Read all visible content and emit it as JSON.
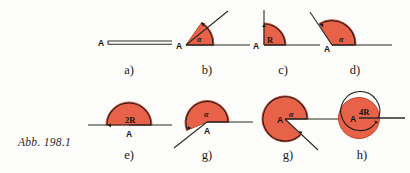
{
  "figure": {
    "caption": "Abb. 198.1",
    "background_color": "#fcfcfa",
    "sector_fill": "#e8624a",
    "sector_stroke": "#c03a22",
    "line_color": "#2b2b26",
    "panels": [
      {
        "id": "a",
        "label": "a)",
        "vertex_label": "A",
        "angle_label": "",
        "angle_degrees": 0,
        "description": "zero angle, two coincident rays drawn as double line",
        "type": "zero-angle"
      },
      {
        "id": "b",
        "label": "b)",
        "vertex_label": "A",
        "angle_label": "α",
        "angle_degrees": 55,
        "description": "acute angle alpha",
        "type": "acute-angle"
      },
      {
        "id": "c",
        "label": "c)",
        "vertex_label": "A",
        "angle_label": "R",
        "angle_degrees": 90,
        "description": "right angle R",
        "type": "right-angle"
      },
      {
        "id": "d",
        "label": "d)",
        "vertex_label": "A",
        "angle_label": "α",
        "angle_degrees": 120,
        "description": "obtuse angle alpha",
        "type": "obtuse-angle"
      },
      {
        "id": "e",
        "label": "e)",
        "vertex_label": "A",
        "angle_label": "2R",
        "angle_degrees": 180,
        "description": "straight angle 2R",
        "type": "straight-angle"
      },
      {
        "id": "f",
        "label": "f)",
        "vertex_label": "A",
        "angle_label": "α",
        "angle_degrees": 205,
        "description": "reflex angle alpha",
        "type": "reflex-angle"
      },
      {
        "id": "g",
        "label": "g)",
        "vertex_label": "A",
        "angle_label": "α",
        "angle_degrees": 310,
        "description": "large reflex angle alpha",
        "type": "reflex-angle"
      },
      {
        "id": "h",
        "label": "h)",
        "vertex_label": "A",
        "angle_label": "4R",
        "angle_degrees": 360,
        "description": "full angle 4R",
        "type": "full-angle"
      }
    ]
  }
}
